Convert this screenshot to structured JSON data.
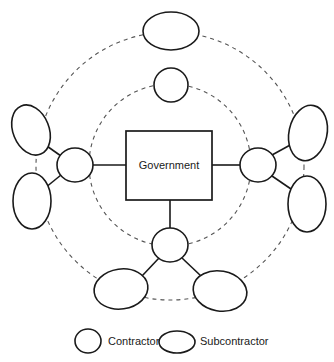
{
  "canvas": {
    "width": 334,
    "height": 362,
    "background": "#ffffff"
  },
  "hub": {
    "label": "Government",
    "x": 126,
    "y": 131,
    "width": 86,
    "height": 69,
    "stroke": "#1a1a1a",
    "fill": "#ffffff"
  },
  "rings": [
    {
      "name": "inner-dashed-ring",
      "cx": 170,
      "cy": 165,
      "r": 81,
      "stroke": "#555555",
      "dash": "4 4"
    },
    {
      "name": "outer-dashed-ring",
      "cx": 170,
      "cy": 166,
      "r": 134,
      "stroke": "#555555",
      "dash": "4 4"
    }
  ],
  "contractors": [
    {
      "id": "contractor-left",
      "cx": 75,
      "cy": 165,
      "rx": 18,
      "ry": 17,
      "rotate": 0
    },
    {
      "id": "contractor-right",
      "cx": 258,
      "cy": 165,
      "rx": 18,
      "ry": 17,
      "rotate": 0
    },
    {
      "id": "contractor-bottom",
      "cx": 170,
      "cy": 245,
      "rx": 18,
      "ry": 17,
      "rotate": 0
    },
    {
      "id": "contractor-top",
      "cx": 171,
      "cy": 85,
      "rx": 17,
      "ry": 17,
      "rotate": 0
    }
  ],
  "subcontractors": [
    {
      "id": "sub-top",
      "cx": 171,
      "cy": 31,
      "rx": 28,
      "ry": 19,
      "rotate": 0
    },
    {
      "id": "sub-left-upper",
      "cx": 31,
      "cy": 130,
      "rx": 18,
      "ry": 26,
      "rotate": -22
    },
    {
      "id": "sub-left-lower",
      "cx": 32,
      "cy": 201,
      "rx": 19,
      "ry": 28,
      "rotate": 0
    },
    {
      "id": "sub-right-upper",
      "cx": 308,
      "cy": 133,
      "rx": 19,
      "ry": 28,
      "rotate": 12
    },
    {
      "id": "sub-right-lower",
      "cx": 307,
      "cy": 204,
      "rx": 19,
      "ry": 28,
      "rotate": 0
    },
    {
      "id": "sub-bottom-left",
      "cx": 121,
      "cy": 289,
      "rx": 27,
      "ry": 20,
      "rotate": -8
    },
    {
      "id": "sub-bottom-right",
      "cx": 220,
      "cy": 291,
      "rx": 27,
      "ry": 20,
      "rotate": 10
    }
  ],
  "links": [
    {
      "from": "hub-left-edge",
      "x1": 126,
      "y1": 165,
      "x2": 93,
      "y2": 165
    },
    {
      "from": "hub-right-edge",
      "x1": 212,
      "y1": 165,
      "x2": 240,
      "y2": 165
    },
    {
      "from": "hub-bottom-edge",
      "x1": 170,
      "y1": 200,
      "x2": 170,
      "y2": 228
    },
    {
      "from": "contractor-left",
      "x1": 61,
      "y1": 156,
      "x2": 44,
      "y2": 144
    },
    {
      "from": "contractor-left",
      "x1": 61,
      "y1": 175,
      "x2": 45,
      "y2": 188
    },
    {
      "from": "contractor-right",
      "x1": 272,
      "y1": 155,
      "x2": 292,
      "y2": 144
    },
    {
      "from": "contractor-right",
      "x1": 272,
      "y1": 176,
      "x2": 291,
      "y2": 189
    },
    {
      "from": "contractor-bottom",
      "x1": 159,
      "y1": 258,
      "x2": 142,
      "y2": 276
    },
    {
      "from": "contractor-bottom",
      "x1": 182,
      "y1": 258,
      "x2": 201,
      "y2": 276
    }
  ],
  "legend": {
    "items": [
      {
        "id": "legend-contractor",
        "label": "Contractor",
        "shape": "circle",
        "cx": 88,
        "cy": 341,
        "rx": 13,
        "ry": 12,
        "label_x": 108
      },
      {
        "id": "legend-subcontractor",
        "label": "Subcontractor",
        "shape": "ellipse",
        "cx": 177,
        "cy": 342,
        "rx": 18,
        "ry": 11,
        "label_x": 200
      }
    ]
  }
}
